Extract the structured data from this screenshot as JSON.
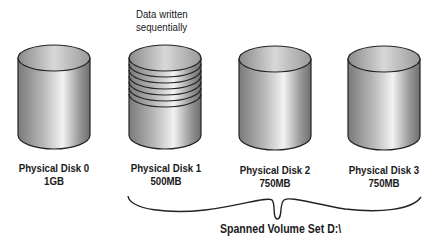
{
  "annotation": {
    "line1": "Data written",
    "line2": "sequentially"
  },
  "disks": [
    {
      "name": "Physical Disk 0",
      "size": "1GB",
      "striped": false
    },
    {
      "name": "Physical Disk 1",
      "size": "500MB",
      "striped": true
    },
    {
      "name": "Physical Disk 2",
      "size": "750MB",
      "striped": false
    },
    {
      "name": "Physical Disk 3",
      "size": "750MB",
      "striped": false
    }
  ],
  "brace": {
    "label": "Spanned Volume Set D:\\"
  }
}
